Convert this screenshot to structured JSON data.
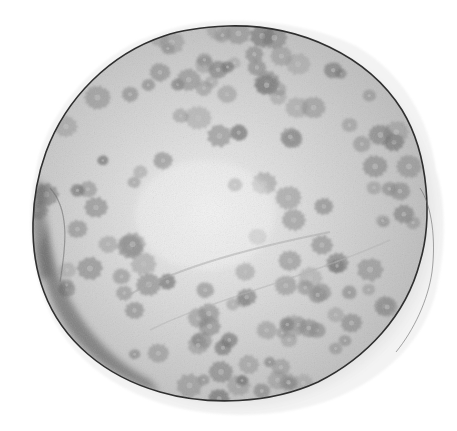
{
  "image": {
    "subject": "Polished cross-section of a fossil coral slab",
    "description": "Round, slightly irregular grayscale specimen showing numerous star-shaped corallites on a pale matrix, outlined by a thin dark rim with a translucent outer edge",
    "background_color": "#ffffff",
    "palette": {
      "matrix_light": "#d9d9d9",
      "matrix_center": "#eeeeee",
      "corallite": "#8a8a8a",
      "corallite_dark": "#6e6e6e",
      "rim": "#2f2f2f",
      "halo": "#cfcfcf",
      "edge_shadow": "#555555"
    },
    "corallite_count": 140
  }
}
